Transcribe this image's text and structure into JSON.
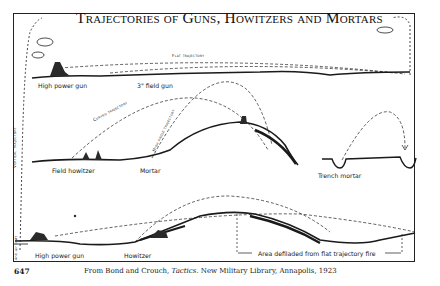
{
  "title": "Trajectories of Guns, Howitzers and Mortars",
  "page_number": "647",
  "caption": {
    "prefix": "From Bond and Crouch, ",
    "italic": "Tactics",
    "suffix": ". New Military Library, Annapolis, 1923"
  },
  "panels": {
    "top": {
      "trajectory_label": "Flat trajectory",
      "labels": [
        "High power gun",
        "3\" field gun"
      ]
    },
    "middle": {
      "trajectory_labels": [
        "Curved trajectory",
        "High angle trajectory"
      ],
      "labels": [
        "Field howitzer",
        "Mortar",
        "Trench mortar"
      ]
    },
    "bottom": {
      "labels": [
        "High power gun",
        "Howitzer"
      ],
      "defilade_label": "Area defiladed from flat trajectory fire"
    },
    "side": {
      "vertical_label": "Vertical trajectory",
      "corner_label": "Anti-air craft"
    }
  },
  "colors": {
    "ink": "#1a1a1a",
    "paper": "#ffffff"
  }
}
